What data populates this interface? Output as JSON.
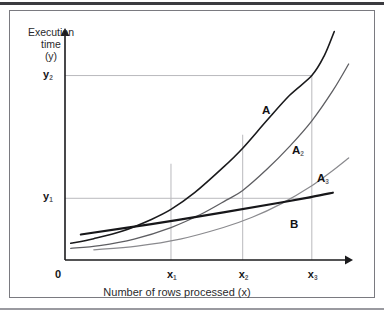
{
  "figure": {
    "frame_color": "#7a7a80",
    "scan_edge_color": "#3b3b3f",
    "background": "#ffffff"
  },
  "axes": {
    "y_title_line1": "Execution",
    "y_title_line2": "time",
    "y_title_line3": "(y)",
    "x_title": "Number of rows processed (x)",
    "origin_label": "0",
    "axis_color": "#1b1b1d",
    "gridline_color": "#b9b9bd"
  },
  "y_ticks": [
    {
      "id": "y1",
      "base": "y",
      "sub": "1",
      "value_px": 222
    },
    {
      "id": "y2",
      "base": "y",
      "sub": "2",
      "value_px": 90
    }
  ],
  "x_ticks": [
    {
      "id": "x1",
      "base": "x",
      "sub": "1",
      "value_px": 160
    },
    {
      "id": "x2",
      "base": "x",
      "sub": "2",
      "value_px": 215
    },
    {
      "id": "x3",
      "base": "x",
      "sub": "3",
      "value_px": 268
    }
  ],
  "curve_labels": [
    {
      "id": "A",
      "base": "A",
      "sub": "",
      "x": 262,
      "y": 104
    },
    {
      "id": "A2",
      "base": "A",
      "sub": "2",
      "x": 292,
      "y": 144
    },
    {
      "id": "A3",
      "base": "A",
      "sub": "3",
      "x": 317,
      "y": 172
    },
    {
      "id": "B",
      "base": "B",
      "sub": "",
      "x": 290,
      "y": 218
    }
  ],
  "chart_data": {
    "type": "line",
    "title": "",
    "xlabel": "Number of rows processed (x)",
    "ylabel": "Execution time (y)",
    "xlim": [
      0,
      1
    ],
    "ylim": [
      0,
      1
    ],
    "grid": false,
    "legend": "inline-curve-labels",
    "note": "Axes are qualitative: only symbolic ticks x1,x2,x3 and y1,y2 are marked. Values below are normalized 0-1 fractions of the plot area.",
    "axis_ticks": {
      "x": [
        "0",
        "x1",
        "x2",
        "x3"
      ],
      "x_positions": [
        0.0,
        0.368,
        0.617,
        0.857
      ],
      "y": [
        "y1",
        "y2"
      ],
      "y_positions": [
        0.266,
        0.795
      ]
    },
    "reference_lines": [
      {
        "name": "y1-horizontal",
        "orientation": "horizontal",
        "at": 0.266,
        "from": 0.0,
        "to": 0.857,
        "color": "#b9b9bd"
      },
      {
        "name": "y2-horizontal",
        "orientation": "horizontal",
        "at": 0.795,
        "from": 0.0,
        "to": 0.857,
        "color": "#b9b9bd"
      },
      {
        "name": "x1-vertical",
        "orientation": "vertical",
        "at": 0.368,
        "from": 0.0,
        "to": 0.415,
        "color": "#b9b9bd"
      },
      {
        "name": "x2-vertical",
        "orientation": "vertical",
        "at": 0.617,
        "from": 0.0,
        "to": 0.54,
        "color": "#b9b9bd"
      },
      {
        "name": "x3-vertical",
        "orientation": "vertical",
        "at": 0.857,
        "from": 0.0,
        "to": 0.795,
        "color": "#b9b9bd"
      }
    ],
    "series": [
      {
        "name": "A",
        "style": "exponential",
        "color": "#1a1a1c",
        "width": 1.6,
        "description": "Steepest exponential full-table-scan curve; crosses y2 at x3.",
        "x": [
          0.02,
          0.1,
          0.2,
          0.3,
          0.368,
          0.45,
          0.55,
          0.617,
          0.7,
          0.78,
          0.857,
          0.9,
          0.935
        ],
        "y": [
          0.072,
          0.092,
          0.125,
          0.175,
          0.218,
          0.29,
          0.4,
          0.482,
          0.6,
          0.71,
          0.795,
          0.88,
          0.985
        ]
      },
      {
        "name": "A2",
        "style": "exponential",
        "color": "#5e5e62",
        "width": 1.3,
        "description": "Middle exponential curve, shifted right of A.",
        "x": [
          0.02,
          0.12,
          0.24,
          0.368,
          0.47,
          0.56,
          0.617,
          0.7,
          0.78,
          0.857,
          0.93,
          0.985
        ],
        "y": [
          0.05,
          0.062,
          0.09,
          0.14,
          0.196,
          0.258,
          0.3,
          0.39,
          0.49,
          0.6,
          0.73,
          0.845
        ]
      },
      {
        "name": "A3",
        "style": "exponential",
        "color": "#8a8a8e",
        "width": 1.2,
        "description": "Rightmost, shallowest exponential curve.",
        "x": [
          0.1,
          0.25,
          0.4,
          0.55,
          0.65,
          0.75,
          0.857,
          0.93,
          0.985
        ],
        "y": [
          0.044,
          0.06,
          0.09,
          0.14,
          0.184,
          0.242,
          0.32,
          0.386,
          0.44
        ]
      },
      {
        "name": "B",
        "style": "linear",
        "color": "#17171a",
        "width": 2.2,
        "description": "Near-linear index-access curve; crosses y1 just before x3.",
        "x": [
          0.055,
          0.3,
          0.55,
          0.75,
          0.857,
          0.93
        ],
        "y": [
          0.11,
          0.155,
          0.205,
          0.248,
          0.272,
          0.29
        ]
      }
    ]
  }
}
